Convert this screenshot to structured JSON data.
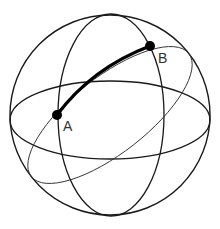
{
  "diagram": {
    "type": "great-circle-on-sphere",
    "colors": {
      "background": "#ffffff",
      "stroke": "#1a1a1a",
      "arc": "#000000",
      "label": "#333333"
    },
    "sphere": {
      "cx": 110,
      "cy": 115,
      "r": 100
    },
    "meridian": {
      "cx": 111,
      "cy": 115,
      "rx": 53,
      "ry": 101
    },
    "equator": {
      "cx": 110,
      "cy": 120,
      "rx": 100,
      "ry": 39
    },
    "great_circle": {
      "cx": 110,
      "cy": 115,
      "rx": 100,
      "ry": 38,
      "rotation_deg": -38
    },
    "points": [
      {
        "id": "A",
        "label": "A",
        "x": 57,
        "y": 115
      },
      {
        "id": "B",
        "label": "B",
        "x": 150,
        "y": 46
      }
    ],
    "arc": {
      "from": "A",
      "to": "B",
      "description": "Shortest path along great circle from A to B"
    }
  }
}
